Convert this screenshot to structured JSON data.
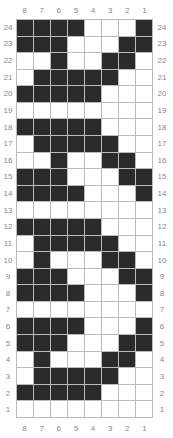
{
  "chart_data": {
    "type": "heatmap",
    "title": "",
    "columns": [
      8,
      7,
      6,
      5,
      4,
      3,
      2,
      1
    ],
    "rows_top_to_bottom": [
      24,
      23,
      22,
      21,
      20,
      19,
      18,
      17,
      16,
      15,
      14,
      13,
      12,
      11,
      10,
      9,
      8,
      7,
      6,
      5,
      4,
      3,
      2,
      1
    ],
    "colors": {
      "filled": "#2b2b2b",
      "empty": "#ffffff",
      "gridline": "#bbbbbb",
      "label": "#888888"
    },
    "grid": [
      [
        1,
        1,
        1,
        1,
        0,
        0,
        0,
        1
      ],
      [
        1,
        1,
        1,
        0,
        0,
        0,
        1,
        1
      ],
      [
        0,
        0,
        1,
        0,
        0,
        1,
        1,
        0
      ],
      [
        0,
        1,
        1,
        1,
        1,
        1,
        0,
        0
      ],
      [
        1,
        1,
        1,
        1,
        1,
        0,
        0,
        0
      ],
      [
        0,
        0,
        0,
        0,
        0,
        0,
        0,
        0
      ],
      [
        1,
        1,
        1,
        1,
        1,
        0,
        0,
        0
      ],
      [
        0,
        1,
        1,
        1,
        1,
        1,
        0,
        0
      ],
      [
        0,
        0,
        1,
        0,
        0,
        1,
        1,
        0
      ],
      [
        1,
        1,
        1,
        0,
        0,
        0,
        1,
        1
      ],
      [
        1,
        1,
        1,
        1,
        0,
        0,
        0,
        1
      ],
      [
        0,
        0,
        0,
        0,
        0,
        0,
        0,
        0
      ],
      [
        1,
        1,
        1,
        1,
        1,
        0,
        0,
        0
      ],
      [
        0,
        1,
        1,
        1,
        1,
        1,
        0,
        0
      ],
      [
        0,
        1,
        0,
        0,
        0,
        1,
        1,
        0
      ],
      [
        1,
        1,
        1,
        0,
        0,
        0,
        1,
        1
      ],
      [
        1,
        1,
        1,
        1,
        0,
        0,
        0,
        1
      ],
      [
        0,
        0,
        0,
        0,
        0,
        0,
        0,
        0
      ],
      [
        1,
        1,
        1,
        1,
        0,
        0,
        0,
        1
      ],
      [
        1,
        1,
        1,
        0,
        0,
        0,
        1,
        1
      ],
      [
        0,
        1,
        0,
        0,
        0,
        1,
        1,
        0
      ],
      [
        0,
        1,
        1,
        1,
        1,
        1,
        0,
        0
      ],
      [
        1,
        1,
        1,
        1,
        1,
        0,
        0,
        0
      ],
      [
        0,
        0,
        0,
        0,
        0,
        0,
        0,
        0
      ]
    ]
  }
}
